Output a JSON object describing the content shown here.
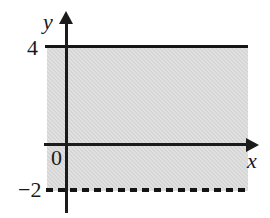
{
  "figure": {
    "kind": "cartesian-graph",
    "background_color": "#ffffff",
    "ink_color": "#1a1a1a",
    "shade_color": "#d5d5d5"
  },
  "axes": {
    "x_axis_name": "x",
    "y_axis_name": "y",
    "origin_label": "0"
  },
  "tick_labels": {
    "y_top": "4",
    "y_bottom": "−2"
  },
  "chart_data": {
    "type": "area",
    "title": "",
    "xlabel": "x",
    "ylabel": "y",
    "xlim": [
      -1.2,
      12
    ],
    "ylim": [
      -3.2,
      5.6
    ],
    "grid": false,
    "legend_position": "none",
    "series": [
      {
        "name": "y = 4",
        "kind": "horizontal-line",
        "y": 4,
        "line_style": "solid",
        "included": true,
        "label": "4"
      },
      {
        "name": "y = -2",
        "kind": "horizontal-line",
        "y": -2,
        "line_style": "dashed",
        "included": false,
        "label": "−2"
      }
    ],
    "shaded_region": {
      "description": "band between y = -2 (exclusive) and y = 4 (inclusive)",
      "y_lower": -2,
      "y_upper": 4,
      "fill": "#d5d5d5"
    },
    "annotations": [
      "y",
      "x",
      "0",
      "4",
      "−2"
    ]
  }
}
